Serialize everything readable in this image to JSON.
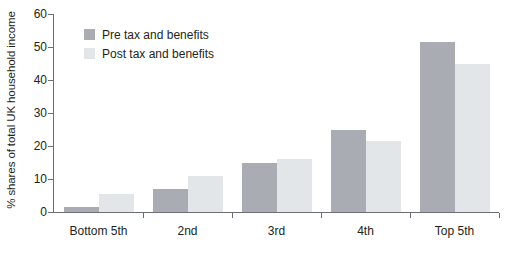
{
  "chart_data": {
    "type": "bar",
    "title": "",
    "subtitle": "",
    "xlabel": "",
    "ylabel": "% shares of total UK household income",
    "categories": [
      "Bottom 5th",
      "2nd",
      "3rd",
      "4th",
      "Top 5th"
    ],
    "series": [
      {
        "name": "Pre tax and benefits",
        "color": "#a9adb3",
        "values": [
          1.5,
          7,
          15,
          25,
          51.5
        ]
      },
      {
        "name": "Post tax and benefits",
        "color": "#e3e6e9",
        "values": [
          5.5,
          11,
          16,
          21.5,
          45
        ]
      }
    ],
    "ylim": [
      0,
      60
    ],
    "yticks": [
      0,
      10,
      20,
      30,
      40,
      50,
      60
    ],
    "ytick_labels": [
      "0",
      "10",
      "20",
      "30",
      "40",
      "50",
      "60"
    ],
    "grid": false,
    "legend_position": "top-left"
  },
  "legend": {
    "items": [
      {
        "label": "Pre tax and benefits",
        "swatch": "pre"
      },
      {
        "label": "Post tax and benefits",
        "swatch": "post"
      }
    ]
  },
  "axes": {
    "y_title": "% shares of total UK household income"
  }
}
